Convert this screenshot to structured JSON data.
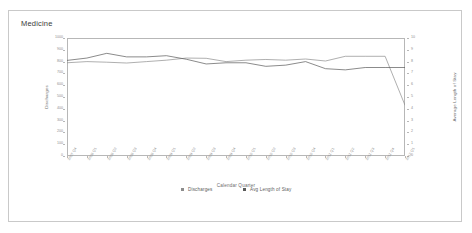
{
  "panel": {
    "title": "Medicine"
  },
  "legend": {
    "items": [
      {
        "label": "Discharges",
        "color": "#8c8c8c",
        "marker": "square-marker"
      },
      {
        "label": "Avg Length of Stay",
        "color": "#595959",
        "marker": "square-marker"
      }
    ]
  },
  "chart_data": {
    "type": "line",
    "title": "Medicine",
    "xlabel": "Calendar Quarter",
    "ylabel": "Discharges",
    "y2label": "Average Length of Stay",
    "grid": false,
    "legend_position": "bottom",
    "categories": [
      "2007 Q4",
      "2008 Q1",
      "2008 Q2",
      "2008 Q3",
      "2008 Q4",
      "2009 Q1",
      "2009 Q2",
      "2009 Q3",
      "2009 Q4",
      "2010 Q1",
      "2010 Q2",
      "2010 Q3",
      "2010 Q4",
      "2011 Q1",
      "2011 Q2",
      "2011 Q3",
      "2011 Q4",
      "2012 Q1"
    ],
    "ylim": [
      0,
      1000
    ],
    "yticks": [
      0,
      100,
      200,
      300,
      400,
      500,
      600,
      700,
      800,
      900,
      1000
    ],
    "y2lim": [
      0,
      10
    ],
    "y2ticks": [
      0,
      1,
      2,
      3,
      4,
      5,
      6,
      7,
      8,
      9,
      10
    ],
    "series": [
      {
        "name": "Discharges",
        "axis": "left",
        "color": "#8c8c8c",
        "values": [
          790,
          800,
          795,
          788,
          800,
          812,
          830,
          828,
          800,
          812,
          818,
          812,
          822,
          805,
          845,
          845,
          845,
          430
        ]
      },
      {
        "name": "Avg Length of Stay",
        "axis": "right",
        "color": "#595959",
        "values": [
          8.1,
          8.3,
          8.7,
          8.4,
          8.4,
          8.5,
          8.2,
          7.8,
          7.9,
          7.9,
          7.6,
          7.7,
          8.0,
          7.4,
          7.3,
          7.5,
          7.5,
          7.5
        ]
      }
    ]
  }
}
